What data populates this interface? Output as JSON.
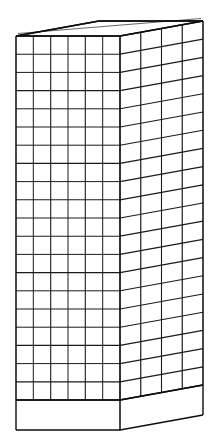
{
  "figure": {
    "title": "Axonometric line drawing of a gridded rectangular slab",
    "medium": "black ink line drawing on white ground",
    "projection": "axonometric (oblique / paraline), vanishing-point-free",
    "view": "three-quarter view from slightly above, front-left"
  },
  "colors": {
    "background": "#ffffff",
    "line": "#1a1a1a",
    "outline": "#0d0d0d",
    "face_fill": "#ffffff"
  },
  "canvas": {
    "width": 215,
    "height": 440
  },
  "geometry": {
    "front_face": {
      "label": "front face",
      "x_left": 16,
      "x_right": 120,
      "y_top": 36,
      "y_bottom": 400,
      "columns": 6,
      "rows": 20,
      "cell_width": 17.33,
      "cell_height": 18.2
    },
    "right_face": {
      "label": "right side face",
      "x_near": 120,
      "x_far": 203,
      "y_top_near": 36,
      "y_top_far": 21,
      "y_bottom_near": 400,
      "y_bottom_far": 385,
      "columns": 4,
      "rows": 20,
      "recede_dx": 83,
      "recede_dy": -15
    },
    "top_face": {
      "label": "top face",
      "near_left": [
        16,
        36
      ],
      "near_right": [
        120,
        36
      ],
      "far_right": [
        203,
        21
      ],
      "far_left": [
        99,
        21
      ],
      "gridded": false
    },
    "base_band": {
      "label": "plinth base band",
      "y_top_front": 400,
      "y_bottom_front": 430,
      "y_bottom_far": 415,
      "height": 30,
      "gridded": false
    }
  },
  "counts": {
    "front_columns_label": "6",
    "front_rows_label": "20",
    "side_columns_label": "4",
    "total_front_cells_label": "120",
    "total_side_cells_label": "80"
  },
  "stroke": {
    "grid_width": 1,
    "outline_width": 1.4,
    "corner_width": 1.6
  }
}
